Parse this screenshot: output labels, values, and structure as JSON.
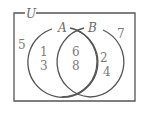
{
  "diagram": {
    "type": "venn",
    "universe_label": "U",
    "sets": [
      {
        "label": "A"
      },
      {
        "label": "B"
      }
    ],
    "regions": {
      "outside": [
        "5",
        "7"
      ],
      "a_only": [
        "1",
        "3"
      ],
      "a_and_b": [
        "6",
        "8"
      ],
      "b_only": [
        "2",
        "4"
      ]
    },
    "colors": {
      "stroke": "#555555",
      "text": "#7a7a7a"
    }
  }
}
